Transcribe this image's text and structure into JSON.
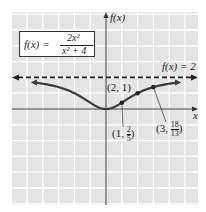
{
  "chart_data": {
    "type": "line",
    "title": "",
    "function": "f(x) = 2x^2 / (x^2 + 4)",
    "formula": {
      "lhs": "f(x) =",
      "numerator": "2x²",
      "denominator": "x² + 4"
    },
    "xlabel": "x",
    "ylabel": "f(x)",
    "xlim": [
      -6,
      5.8
    ],
    "ylim": [
      -6,
      6
    ],
    "grid": true,
    "asymptote": {
      "label": "f(x) = 2",
      "y": 2,
      "style": "dashed"
    },
    "labeled_points": [
      {
        "x": 1,
        "y": 0.4,
        "label": "(1, 2/5)",
        "label_parts": [
          "(1, ",
          "2",
          "5",
          ")"
        ]
      },
      {
        "x": 2,
        "y": 1,
        "label": "(2, 1)"
      },
      {
        "x": 3,
        "y": 1.3846,
        "label": "(3, 18/13)",
        "label_parts": [
          "(3, ",
          "18",
          "13",
          ")"
        ]
      }
    ],
    "curve_x_range": [
      -4.5,
      4.5
    ],
    "colors": {
      "curve": "#3a3a3a",
      "grid_bg": "#e4e4e4",
      "grid_line": "#ffffff",
      "axis": "#333333"
    }
  }
}
